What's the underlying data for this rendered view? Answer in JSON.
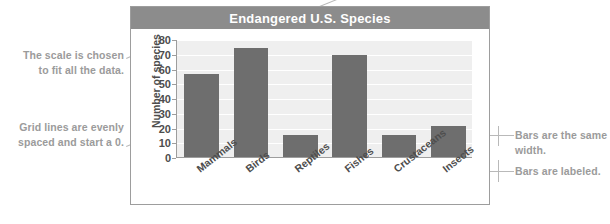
{
  "chart_data": {
    "type": "bar",
    "title": "Endangered U.S. Species",
    "xlabel": "",
    "ylabel": "Number of species",
    "categories": [
      "Mammals",
      "Birds",
      "Reptiles",
      "Fishes",
      "Crustaceans",
      "Insects"
    ],
    "values": [
      56,
      74,
      15,
      69,
      15,
      21
    ],
    "ylim": [
      0,
      80
    ],
    "yticks": [
      0,
      10,
      20,
      30,
      40,
      50,
      60,
      70,
      80
    ],
    "grid": true,
    "legend": "none",
    "bar_color": "#6e6e6e",
    "plot_background": "#efefef",
    "title_bar_color": "#8c8c8c"
  },
  "annotations": {
    "scale": "The scale is chosen\nto fit all the data.",
    "scale_line1": "The scale is chosen",
    "scale_line2": "to fit all the data.",
    "gridlines_line1": "Grid lines are evenly",
    "gridlines_line2": "spaced and start a 0.",
    "bars_width_line1": "Bars are the same",
    "bars_width_line2": "width.",
    "bars_labeled": "Bars are labeled."
  },
  "colors": {
    "annotation_text": "#9b9b9b",
    "axis_text": "#4d4d4d",
    "leader_line": "#b9b9b9",
    "frame_border": "#9d9d9d"
  }
}
